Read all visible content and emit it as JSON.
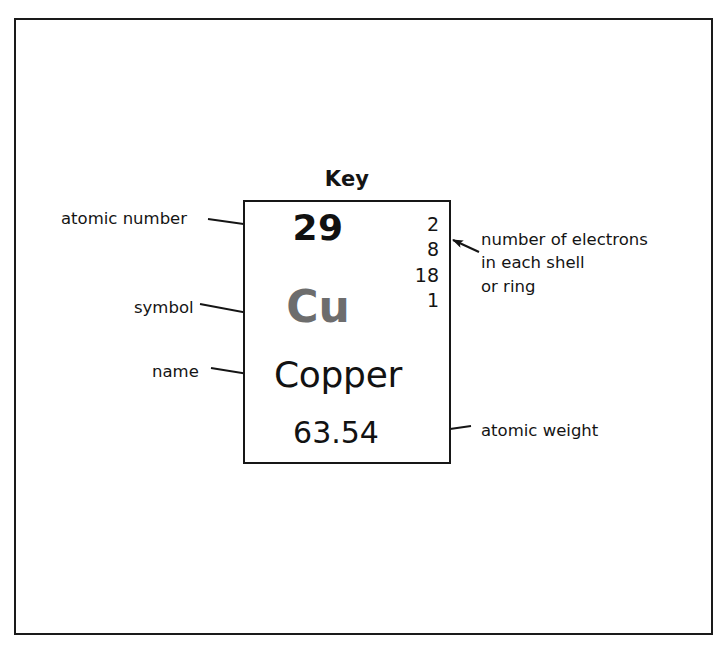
{
  "figure": {
    "title": "Key",
    "frame_color": "#1a1a1a",
    "box_color": "#171717"
  },
  "element": {
    "atomic_number": "29",
    "symbol": "Cu",
    "symbol_color": "#6d6d6d",
    "name": "Copper",
    "atomic_weight": "63.54",
    "shells": [
      "2",
      "8",
      "18",
      "1"
    ]
  },
  "callouts": {
    "atomic_number": "atomic number",
    "symbol": "symbol",
    "name": "name",
    "electrons": "number of electrons\nin each shell\nor ring",
    "atomic_weight": "atomic weight"
  }
}
